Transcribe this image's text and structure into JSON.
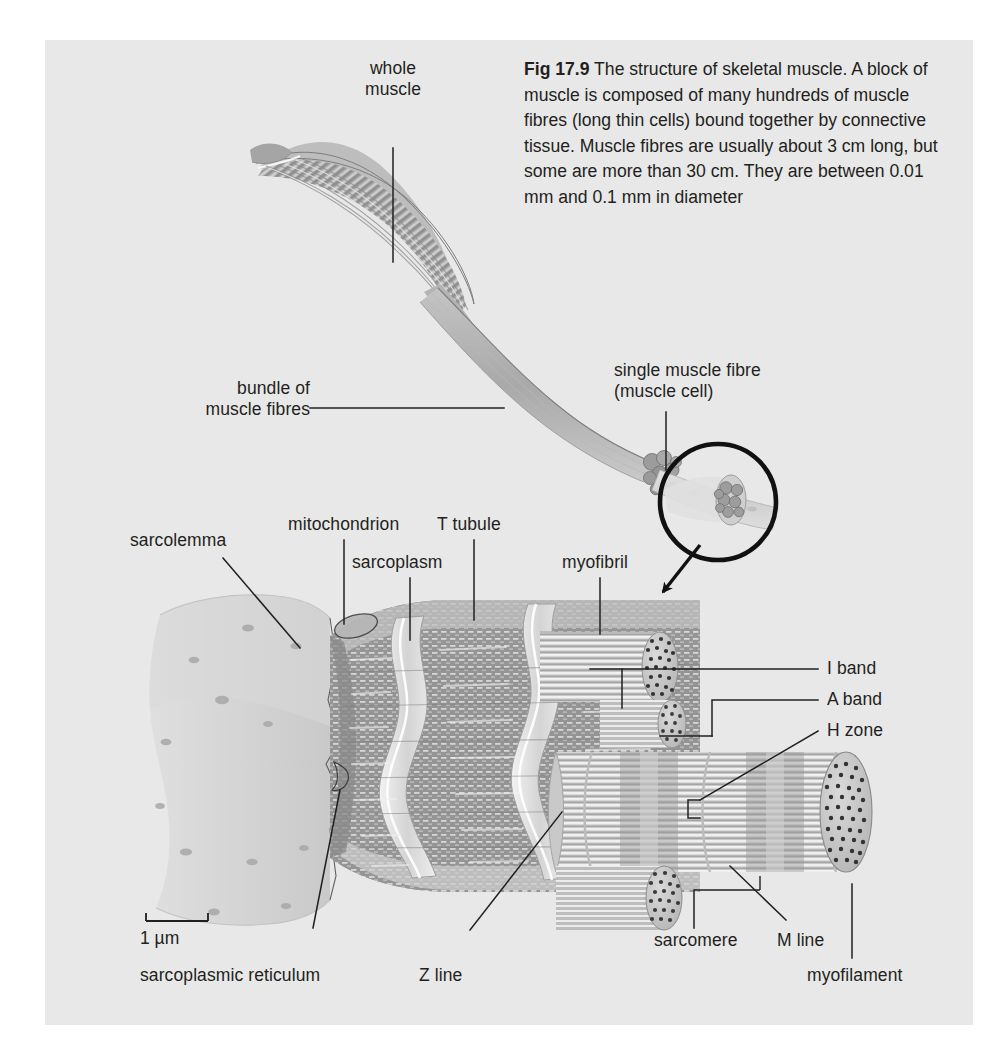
{
  "figure": {
    "number": "Fig 17.9",
    "caption": "The structure of skeletal muscle. A block of muscle is composed of many hundreds of muscle fibres (long thin cells) bound together by connective tissue. Muscle fibres are usually about 3 cm long, but some are more than 30 cm. They are between 0.01 mm and 0.1 mm in diameter",
    "background_color": "#e8e8e8",
    "ink_color": "#231f20"
  },
  "scale_bar": {
    "label": "1 µm",
    "length_px": 62
  },
  "labels": {
    "whole_muscle": "whole\nmuscle",
    "bundle_of_muscle_fibres": "bundle of\nmuscle fibres",
    "single_muscle_fibre": "single muscle fibre\n(muscle cell)",
    "sarcolemma": "sarcolemma",
    "mitochondrion": "mitochondrion",
    "sarcoplasm": "sarcoplasm",
    "t_tubule": "T tubule",
    "myofibril": "myofibril",
    "i_band": "I band",
    "a_band": "A band",
    "h_zone": "H zone",
    "sarcoplasmic_reticulum": "sarcoplasmic reticulum",
    "z_line": "Z line",
    "sarcomere": "sarcomere",
    "m_line": "M line",
    "myofilament": "myofilament"
  },
  "palette": {
    "muscle_mid": "#a6a6a6",
    "muscle_light": "#cccccc",
    "muscle_pale": "#dcdcdc",
    "sarcolemma": "#d6d6d6",
    "sarcoplasm": "#9a9a9a",
    "myofibril": "#c2c2c2",
    "dots": "#3a3a3a",
    "leader": "#231f20"
  }
}
